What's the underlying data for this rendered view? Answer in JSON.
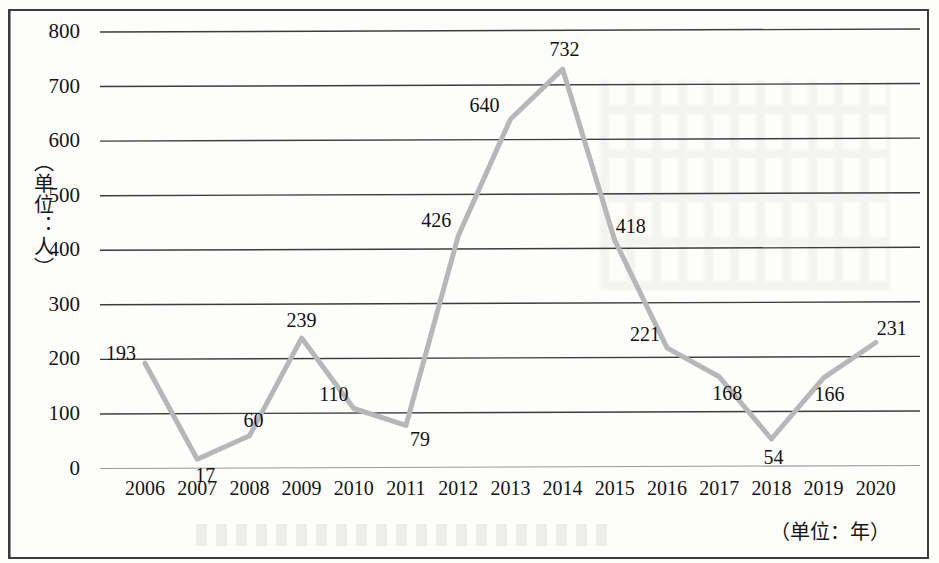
{
  "chart_data": {
    "type": "line",
    "title": "",
    "subtitle": "",
    "xlabel": "（单位：年）",
    "ylabel": "（单位：人）",
    "categories": [
      "2006",
      "2007",
      "2008",
      "2009",
      "2010",
      "2011",
      "2012",
      "2013",
      "2014",
      "2015",
      "2016",
      "2017",
      "2018",
      "2019",
      "2020"
    ],
    "values": [
      193,
      17,
      60,
      239,
      110,
      79,
      426,
      640,
      732,
      418,
      221,
      168,
      54,
      166,
      231
    ],
    "series": [
      {
        "name": "",
        "values": [
          193,
          17,
          60,
          239,
          110,
          79,
          426,
          640,
          732,
          418,
          221,
          168,
          54,
          166,
          231
        ]
      }
    ],
    "point_labels": [
      "193",
      "17",
      "60",
      "239",
      "110",
      "79",
      "426",
      "640",
      "732",
      "418",
      "221",
      "168",
      "54",
      "166",
      "231"
    ],
    "ylim": [
      0,
      800
    ],
    "yticks": [
      0,
      100,
      200,
      300,
      400,
      500,
      600,
      700,
      800
    ],
    "ytick_labels": [
      "0",
      "100",
      "200",
      "300",
      "400",
      "500",
      "600",
      "700",
      "800"
    ],
    "grid": "horizontal",
    "legend": "none",
    "line_color": "#b7b7b7",
    "grid_color": "#3c3c3c",
    "axis_color": "#3a3a3a",
    "text_color": "#141414",
    "marker": "none",
    "line_width": 5
  },
  "axes": {
    "y_unit_caption": "（单位：人）",
    "x_unit_caption": "（单位：年）"
  }
}
